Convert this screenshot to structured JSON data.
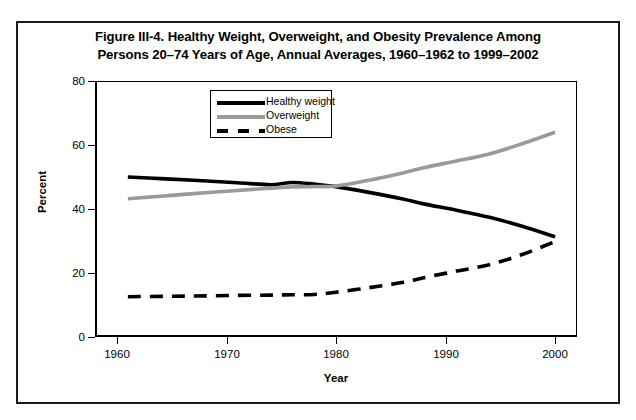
{
  "chart_data": {
    "type": "line",
    "title": "Figure III-4. Healthy Weight, Overweight, and Obesity Prevalence Among Persons 20–74 Years of Age, Annual Averages, 1960–1962 to 1999–2002",
    "title_line1": "Figure III-4. Healthy Weight, Overweight, and Obesity Prevalence Among",
    "title_line2": "Persons 20–74 Years of Age, Annual Averages, 1960–1962 to 1999–2002",
    "xlabel": "Year",
    "ylabel": "Percent",
    "xlim": [
      1958,
      2002
    ],
    "ylim": [
      0,
      80
    ],
    "grid": false,
    "legend_position": "inside-top-center",
    "xticks": [
      1960,
      1970,
      1980,
      1990,
      2000
    ],
    "xtick_labels": [
      "1960",
      "1970",
      "1980",
      "1990",
      "2000"
    ],
    "yticks": [
      0,
      20,
      40,
      60,
      80
    ],
    "ytick_labels": [
      "0",
      "20",
      "40",
      "60",
      "80"
    ],
    "x": [
      1961,
      1964,
      1967,
      1971,
      1974,
      1976,
      1978,
      1980,
      1983,
      1986,
      1988,
      1991,
      1994,
      1997,
      2000
    ],
    "series": [
      {
        "name": "Healthy weight",
        "color": "#000000",
        "style": "solid",
        "width": 3.6,
        "values": [
          50.0,
          49.5,
          49.0,
          48.2,
          47.6,
          48.3,
          47.8,
          47.0,
          45.2,
          43.2,
          41.6,
          39.6,
          37.4,
          34.6,
          31.3
        ]
      },
      {
        "name": "Overweight",
        "color": "#9a9a9a",
        "style": "solid",
        "width": 3.6,
        "values": [
          43.2,
          44.0,
          44.8,
          45.8,
          46.5,
          46.9,
          47.0,
          47.2,
          49.0,
          51.2,
          52.9,
          55.0,
          57.2,
          60.4,
          64.0
        ]
      },
      {
        "name": "Obese",
        "color": "#000000",
        "style": "dashed",
        "width": 3.6,
        "values": [
          12.6,
          12.7,
          12.8,
          13.0,
          13.1,
          13.2,
          13.3,
          14.0,
          15.4,
          17.0,
          18.5,
          20.6,
          22.6,
          25.8,
          29.8
        ]
      }
    ]
  },
  "legend": {
    "items": [
      {
        "label": "Healthy weight",
        "swatch": "solid-black-line"
      },
      {
        "label": "Overweight",
        "swatch": "solid-gray-line"
      },
      {
        "label": "Obese",
        "swatch": "dashed-black-line"
      }
    ]
  },
  "colors": {
    "healthy_weight": "#000000",
    "overweight": "#9a9a9a",
    "obese": "#000000",
    "axis": "#000000",
    "background": "#ffffff"
  }
}
